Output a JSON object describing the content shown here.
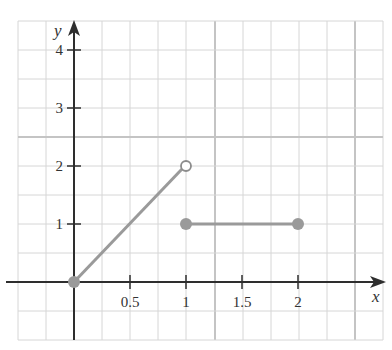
{
  "chart_data": {
    "type": "line",
    "title": "",
    "xlabel": "x",
    "ylabel": "y",
    "xlim": [
      -0.5,
      2.75
    ],
    "ylim": [
      -0.5,
      4.25
    ],
    "grid": true,
    "grid_step_x": 0.25,
    "grid_step_y": 0.5,
    "x_ticks": [
      {
        "value": 0.5,
        "label": "0.5"
      },
      {
        "value": 1,
        "label": "1"
      },
      {
        "value": 1.5,
        "label": "1.5"
      },
      {
        "value": 2,
        "label": "2"
      }
    ],
    "y_ticks": [
      {
        "value": 1,
        "label": "1"
      },
      {
        "value": 2,
        "label": "2"
      },
      {
        "value": 3,
        "label": "3"
      },
      {
        "value": 4,
        "label": "4"
      }
    ],
    "series": [
      {
        "name": "segment-1",
        "description": "y = 2x on [0, 1)",
        "points": [
          {
            "x": 0,
            "y": 0
          },
          {
            "x": 1,
            "y": 2
          }
        ],
        "start_marker": "closed",
        "end_marker": "open"
      },
      {
        "name": "segment-2",
        "description": "y = 1 on [1, 2]",
        "points": [
          {
            "x": 1,
            "y": 1
          },
          {
            "x": 2,
            "y": 1
          }
        ],
        "start_marker": "closed",
        "end_marker": "closed"
      }
    ],
    "legend": null
  },
  "colors": {
    "background": "#ffffff",
    "grid": "#d6d6d6",
    "grid_strong": "#c4c4c4",
    "axis": "#2e2e2e",
    "series": "#9a9a9a",
    "text": "#333333"
  },
  "labels": {
    "x_axis": "x",
    "y_axis": "y",
    "x_ticks": [
      "0.5",
      "1",
      "1.5",
      "2"
    ],
    "y_ticks": [
      "1",
      "2",
      "3",
      "4"
    ]
  }
}
